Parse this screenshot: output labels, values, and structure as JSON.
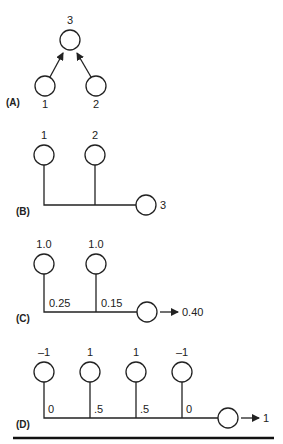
{
  "panels": {
    "A": {
      "label": "(A)",
      "output_value": "3",
      "inputs": [
        "1",
        "2"
      ]
    },
    "B": {
      "label": "(B)",
      "inputs": [
        "1",
        "2"
      ],
      "output_value": "3"
    },
    "C": {
      "label": "(C)",
      "inputs": [
        "1.0",
        "1.0"
      ],
      "weights": [
        "0.25",
        "0.15"
      ],
      "output_value": "0.40"
    },
    "D": {
      "label": "(D)",
      "inputs": [
        "–1",
        "1",
        "1",
        "–1"
      ],
      "weights": [
        "0",
        ".5",
        ".5",
        "0"
      ],
      "output_value": "1"
    }
  },
  "colors": {
    "stroke": "#222222",
    "background": "#ffffff"
  }
}
